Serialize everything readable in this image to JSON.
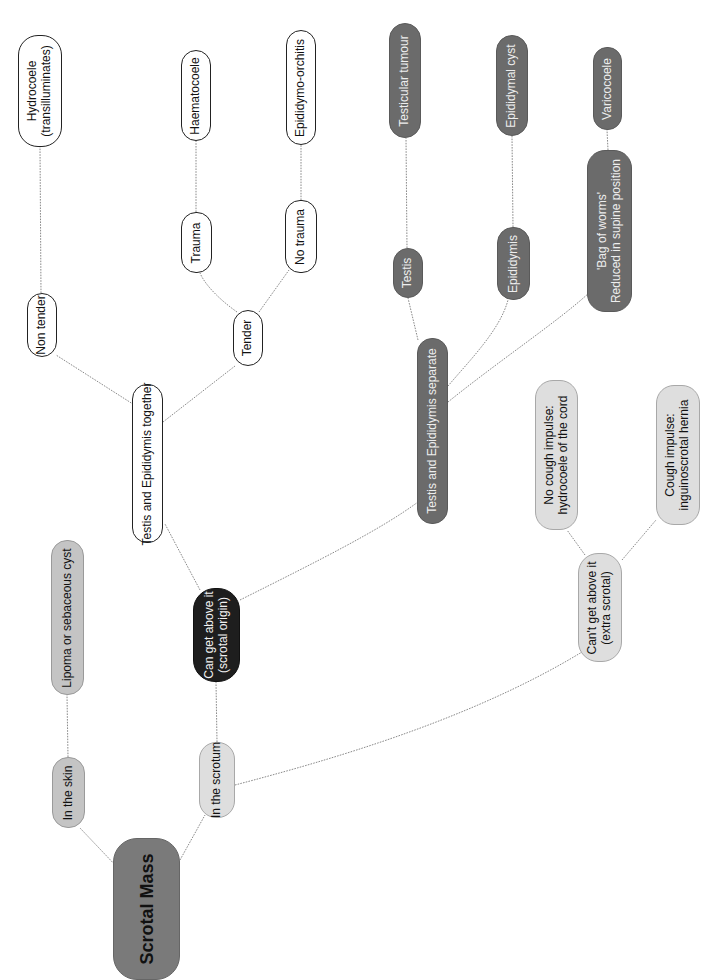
{
  "title": "Scrotal Mass",
  "colors": {
    "root": "#7a7a7a",
    "location": "#c4c4c4",
    "scrotal": "#dedede",
    "can_get_above": "#1e1e1e",
    "together_branch": "#ffffff",
    "separate_branch": "#6b6b6b",
    "edge": "#8a8a8a"
  },
  "nodes": {
    "root": {
      "lines": [
        "Scrotal Mass"
      ]
    },
    "in_skin": {
      "lines": [
        "In the skin"
      ]
    },
    "lipoma": {
      "lines": [
        "Lipoma or sebaceous cyst"
      ]
    },
    "in_scrotum": {
      "lines": [
        "In the scrotum"
      ]
    },
    "can_get_above": {
      "lines": [
        "Can get above it",
        "(scrotal origin)"
      ]
    },
    "together": {
      "lines": [
        "Testis and Epididymis together"
      ]
    },
    "non_tender": {
      "lines": [
        "Non tender"
      ]
    },
    "hydrocoele": {
      "lines": [
        "Hydrocoele",
        "(transilluminates)"
      ]
    },
    "tender": {
      "lines": [
        "Tender"
      ]
    },
    "trauma": {
      "lines": [
        "Trauma"
      ]
    },
    "haematocoele": {
      "lines": [
        "Haematocoele"
      ]
    },
    "no_trauma": {
      "lines": [
        "No trauma"
      ]
    },
    "epididymo_orchitis": {
      "lines": [
        "Epididymo-orchitis"
      ]
    },
    "separate": {
      "lines": [
        "Testis and Epididymis separate"
      ]
    },
    "testis": {
      "lines": [
        "Testis"
      ]
    },
    "testicular_tumour": {
      "lines": [
        "Testicular tumour"
      ]
    },
    "epididymis": {
      "lines": [
        "Epididymis"
      ]
    },
    "epididymal_cyst": {
      "lines": [
        "Epididymal cyst"
      ]
    },
    "bag_of_worms": {
      "lines": [
        "'Bag of worms'",
        "Reduced in supine position"
      ]
    },
    "varicocoele": {
      "lines": [
        "Varicocoele"
      ]
    },
    "cant_get_above": {
      "lines": [
        "Can't get above it",
        "(extra scrotal)"
      ]
    },
    "no_cough": {
      "lines": [
        "No cough impulse:",
        "hydrocoele of the cord"
      ]
    },
    "cough": {
      "lines": [
        "Cough impulse:",
        "inguinoscrotal hernia"
      ]
    }
  }
}
